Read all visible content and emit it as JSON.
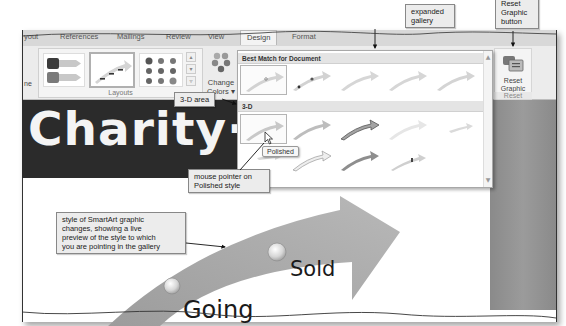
{
  "ribbon": {
    "tabs": [
      {
        "label": "yout",
        "active": false
      },
      {
        "label": "References",
        "active": false
      },
      {
        "label": "Mailings",
        "active": false
      },
      {
        "label": "Review",
        "active": false
      },
      {
        "label": "View",
        "active": false
      },
      {
        "label": "Design",
        "active": true
      },
      {
        "label": "Format",
        "active": false
      }
    ],
    "left_partial_label": "ne",
    "layouts_group_label": "Layouts",
    "change_colors": {
      "line1": "Change",
      "line2": "Colors ▾"
    },
    "reset_graphic": {
      "line1": "Reset",
      "line2": "Graphic",
      "group_label": "Reset"
    }
  },
  "gallery": {
    "sections": [
      {
        "title": "Best Match for Document",
        "rows": 1,
        "items": 5
      },
      {
        "title": "3-D",
        "rows": 2,
        "items": 10
      }
    ],
    "selected_item": "Polished",
    "tooltip": "Polished",
    "scroll_up": "▲",
    "scroll_down": "▼"
  },
  "document": {
    "title_text": "Charity·A",
    "smartart_words": [
      "Going",
      "Sold"
    ]
  },
  "callouts": {
    "expanded_gallery": {
      "line1": "expanded",
      "line2": "gallery"
    },
    "reset_graphic_button": {
      "line1": "Reset",
      "line2": "Graphic",
      "line3": "button"
    },
    "three_d_area": "3-D area",
    "mouse_pointer": {
      "line1": "mouse pointer on",
      "line2": "Polished style"
    },
    "live_preview": {
      "line1": "style of SmartArt graphic",
      "line2": "changes, showing a live",
      "line3": "preview of the style to which",
      "line4": "you are pointing in the gallery"
    }
  },
  "colors": {
    "ribbon_bg": "#ececec",
    "tab_bar": "#d8d8d8",
    "doc_band": "#2b2b2b",
    "arrow": "#a8a8a8",
    "right_band": "#929292",
    "callout_bg": "#ececec"
  }
}
